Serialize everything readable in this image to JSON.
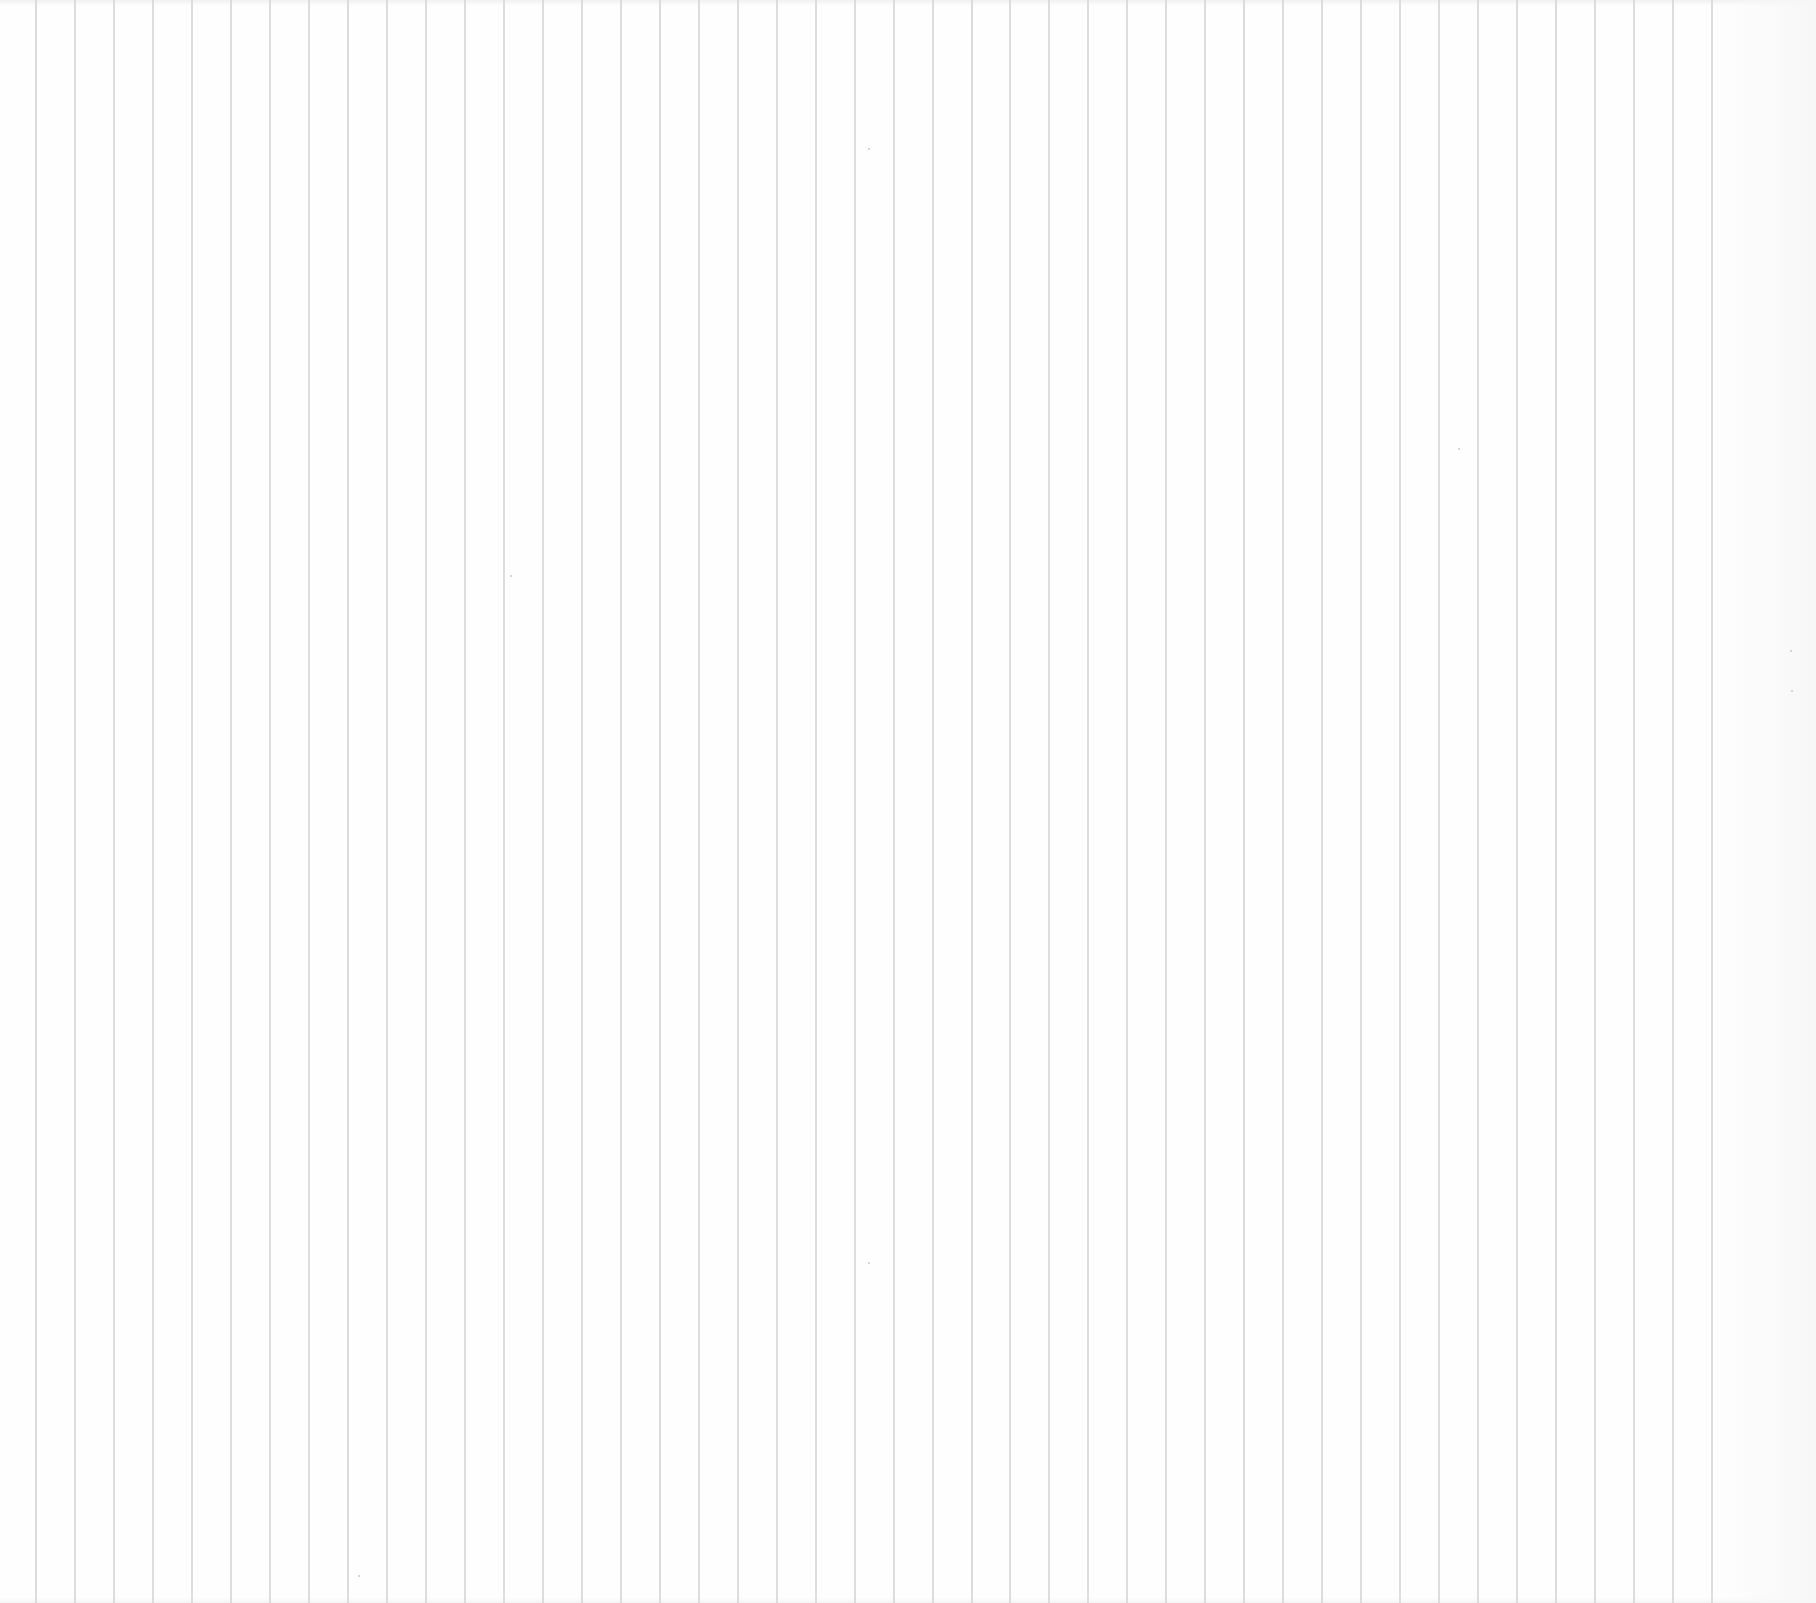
{
  "sheet": {
    "description": "blank vertically ruled paper",
    "width": 1816,
    "height": 1603,
    "background_color": "#fefefe",
    "rule_color": "#d9d9d9",
    "rule_width": 2,
    "rule_count": 44,
    "first_rule_x": 36,
    "rule_spacing": 38.98,
    "right_margin_start_x": 1716
  },
  "specks": [
    {
      "x": 868,
      "y": 148
    },
    {
      "x": 510,
      "y": 575
    },
    {
      "x": 1458,
      "y": 448
    },
    {
      "x": 1790,
      "y": 650
    },
    {
      "x": 1791,
      "y": 690
    },
    {
      "x": 358,
      "y": 1575
    },
    {
      "x": 868,
      "y": 1262
    }
  ]
}
